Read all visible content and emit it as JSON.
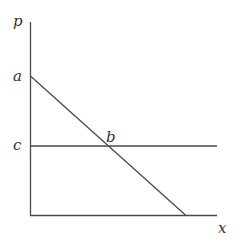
{
  "diagram": {
    "axes": {
      "y_label": "p",
      "x_label": "x"
    },
    "points": {
      "a": "a",
      "b": "b",
      "c": "c"
    },
    "lines": [
      {
        "name": "demand-line",
        "from": "a",
        "to": "x-axis intercept",
        "type": "downward-sloping"
      },
      {
        "name": "price-line",
        "at": "c",
        "type": "horizontal"
      }
    ],
    "colors": {
      "line": "#4a4a4a",
      "text": "#333333",
      "background": "#ffffff"
    }
  }
}
